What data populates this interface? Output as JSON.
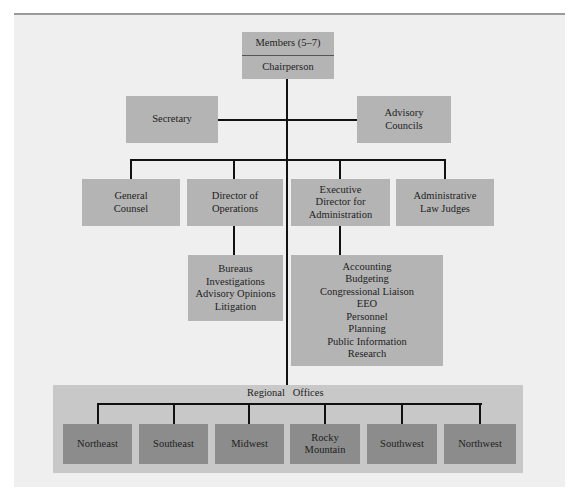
{
  "board": {
    "members": "Members (5–7)",
    "chairperson": "Chairperson"
  },
  "staff": {
    "secretary": "Secretary",
    "advisory_councils": [
      "Advisory",
      "Councils"
    ]
  },
  "second_level": {
    "general_counsel": [
      "General",
      "Counsel"
    ],
    "director_operations": [
      "Director of",
      "Operations"
    ],
    "executive_director": [
      "Executive",
      "Director for",
      "Administration"
    ],
    "admin_law_judges": [
      "Administrative",
      "Law Judges"
    ]
  },
  "operations_units": [
    "Bureaus",
    "Investigations",
    "Advisory  Opinions",
    "Litigation"
  ],
  "administration_units": [
    "Accounting",
    "Budgeting",
    "Congressional Liaison",
    "EEO",
    "Personnel",
    "Planning",
    "Public Information",
    "Research"
  ],
  "regional": {
    "label": "Regional   Offices",
    "offices": [
      "Northeast",
      "Southeast",
      "Midwest",
      "Rocky Mountain",
      "Southwest",
      "Northwest"
    ],
    "rocky_lines": [
      "Rocky",
      "Mountain"
    ]
  },
  "colors": {
    "panel": "#efefef",
    "box": "#b4b4b4",
    "regional_band": "#c8c8c8",
    "regional_box": "#8c8c8c",
    "line": "#111111"
  }
}
